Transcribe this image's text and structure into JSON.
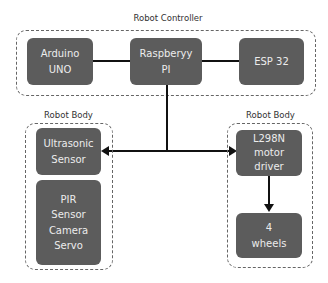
{
  "groups": {
    "controller": {
      "title": "Robot Controller"
    },
    "body_left": {
      "title": "Robot Body"
    },
    "body_right": {
      "title": "Robot Body"
    }
  },
  "nodes": {
    "arduino": {
      "line1": "Arduino",
      "line2": "UNO"
    },
    "raspberry": {
      "line1": "Raspberyy",
      "line2": "PI"
    },
    "esp": {
      "line1": "ESP 32"
    },
    "ultrasonic": {
      "line1": "Ultrasonic",
      "line2": "Sensor"
    },
    "sensors": {
      "line1": "PIR",
      "line2": "Sensor",
      "line3": "Camera",
      "line4": "Servo"
    },
    "motor": {
      "line1": "L298N",
      "line2": "motor",
      "line3": "driver"
    },
    "wheels": {
      "line1": "4",
      "line2": "wheels"
    }
  },
  "colors": {
    "node_fill": "#5c5c5c",
    "node_text": "#ececec",
    "connector": "#111111",
    "group_border": "#666666"
  }
}
